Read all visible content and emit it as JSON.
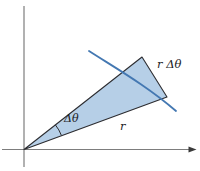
{
  "diagram": {
    "labels": {
      "angle": "Δθ",
      "radius": "r",
      "arc_length": "r Δθ"
    },
    "colors": {
      "background": "#ffffff",
      "sector_fill": "#b6cfe7",
      "sector_edge": "#2c2c30",
      "arc_stroke": "#4478b2",
      "angle_arc": "#2c2c30",
      "axis_line": "#7d7d7d",
      "axis_arrowhead": "#3a3a3a",
      "label_text": "#1c1c1e"
    }
  }
}
